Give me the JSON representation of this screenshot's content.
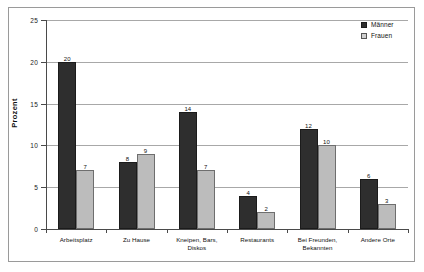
{
  "chart_data": {
    "type": "bar",
    "title": "",
    "subtitle": "",
    "xlabel": "",
    "ylabel": "Prozent",
    "ylim": [
      0,
      25
    ],
    "yticks": [
      0,
      5,
      10,
      15,
      20,
      25
    ],
    "ytick_labels": [
      "0",
      "5",
      "10",
      "15",
      "20",
      "25"
    ],
    "grid": true,
    "legend_position": "top-right",
    "categories": [
      "Arbeitsplatz",
      "Zu Hause",
      "Kneipen, Bars, Diskos",
      "Restaurants",
      "Bei Freunden, Bekannten",
      "Andere Orte"
    ],
    "series": [
      {
        "name": "Männer",
        "color": "#2e2e2e",
        "values": [
          20,
          8,
          14,
          4,
          12,
          6
        ],
        "value_labels": [
          "20",
          "8",
          "14",
          "4",
          "12",
          "6"
        ]
      },
      {
        "name": "Frauen",
        "color": "#bcbcbc",
        "values": [
          7,
          9,
          7,
          2,
          10,
          3
        ],
        "value_labels": [
          "7",
          "9",
          "7",
          "2",
          "10",
          "3"
        ]
      }
    ]
  },
  "legend": {
    "items": [
      {
        "label": "Männer",
        "swatch": "maenner"
      },
      {
        "label": "Frauen",
        "swatch": "frauen"
      }
    ]
  },
  "axes": {
    "y_title": "Prozent"
  }
}
